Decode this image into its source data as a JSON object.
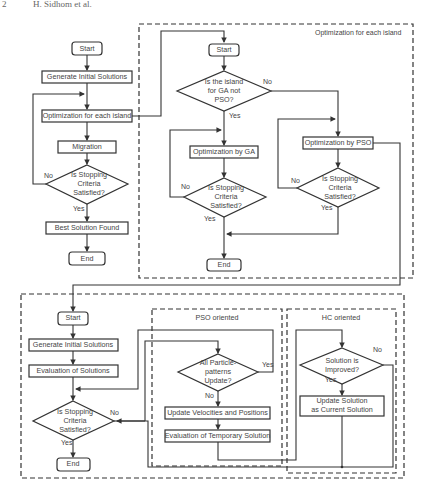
{
  "header": {
    "page_ref": "2",
    "authors": "H. Sidhom et al."
  },
  "main_flow": {
    "start": "Start",
    "generate": "Generate Initial Solutions",
    "optimize": "Optimization for each island",
    "migration": "Migration",
    "stop_q": [
      "Is Stopping",
      "Criteria",
      "Satisfied?"
    ],
    "no": "No",
    "yes": "Yes",
    "best": "Best Solution Found",
    "end": "End"
  },
  "island_panel": {
    "title": "Optimization for each island",
    "start": "Start",
    "ga_q": [
      "Is the island",
      "for GA not",
      "PSO?"
    ],
    "no": "No",
    "yes": "Yes",
    "ga_opt": "Optimization by GA",
    "ga_stop_q": [
      "Is Stopping",
      "Criteria",
      "Satisfied?"
    ],
    "ga_no": "No",
    "ga_yes": "Yes",
    "pso_opt": "Optimization by PSO",
    "pso_stop_q": [
      "Is Stopping",
      "Criteria",
      "Satisfied?"
    ],
    "pso_no": "No",
    "pso_yes": "Yes",
    "end": "End"
  },
  "pso_panel": {
    "start": "Start",
    "generate": "Generate Initial Solutions",
    "evaluate": "Evaluation of Solutions",
    "stop_q": [
      "Is Stopping",
      "Criteria",
      "Satisfied?"
    ],
    "no": "No",
    "yes": "Yes",
    "end": "End",
    "pso_title": "PSO oriented",
    "all_q": [
      "All Particle-",
      "patterns",
      "Update?"
    ],
    "all_yes": "Yes",
    "all_no": "No",
    "update_vp": "Update Velocities and Positions",
    "eval_temp": "Evaluation of Temporary Solution",
    "hc_title": "HC oriented",
    "improved_q": [
      "Solution is",
      "Improved?"
    ],
    "imp_no": "No",
    "imp_yes": "Yes",
    "update_sol": [
      "Update Solution",
      "as Current Solution"
    ]
  }
}
